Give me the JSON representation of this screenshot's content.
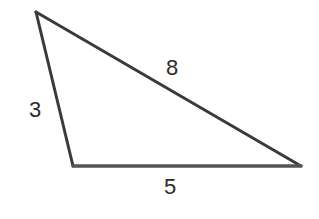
{
  "diagram": {
    "type": "triangle",
    "vertices": {
      "top": [
        36,
        12
      ],
      "bottom_left": [
        73,
        166
      ],
      "bottom_right": [
        301,
        166
      ]
    },
    "sides": {
      "left": {
        "label": "3",
        "position": [
          35,
          110
        ]
      },
      "hypotenuse": {
        "label": "8",
        "position": [
          172,
          68
        ]
      },
      "base": {
        "label": "5",
        "position": [
          170,
          187
        ]
      }
    },
    "colors": {
      "stroke": "#3a3a3a",
      "base_stroke": "#555555",
      "label": "#2a2a2a",
      "background": "#ffffff"
    }
  }
}
